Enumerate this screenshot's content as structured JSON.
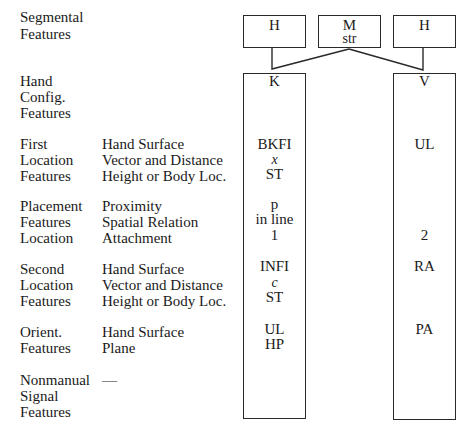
{
  "row_labels": {
    "segmental": [
      "Segmental",
      "Features"
    ],
    "hand_config": [
      "Hand",
      "Config.",
      "Features"
    ],
    "first_location": [
      "First",
      "Location",
      "Features"
    ],
    "placement": [
      "Placement",
      "Features",
      "Location"
    ],
    "second_location": [
      "Second",
      "Location",
      "Features"
    ],
    "orient": [
      "Orient.",
      "Features"
    ],
    "nonmanual": [
      "Nonmanual",
      "Signal",
      "Features"
    ]
  },
  "sub_labels": {
    "first_location": [
      "Hand Surface",
      "Vector and Distance",
      "Height or Body Loc."
    ],
    "placement": [
      "Proximity",
      "Spatial Relation",
      "Attachment"
    ],
    "second_location": [
      "Hand Surface",
      "Vector and Distance",
      "Height or Body Loc."
    ],
    "orient": [
      "Hand Surface",
      "Plane"
    ],
    "nonmanual": [
      "—"
    ]
  },
  "segments": [
    {
      "label": "H",
      "sub": ""
    },
    {
      "label": "M",
      "sub": "str"
    },
    {
      "label": "H",
      "sub": ""
    }
  ],
  "columns": {
    "left": {
      "hand_config": "K",
      "first_location": [
        "BKFI",
        "x",
        "ST"
      ],
      "placement": [
        "p",
        "in line",
        "1"
      ],
      "second_location": [
        "INFI",
        "c",
        "ST"
      ],
      "orient": [
        "UL",
        "HP"
      ]
    },
    "right": {
      "hand_config": "V",
      "first_location": [
        "UL"
      ],
      "placement": [
        "2"
      ],
      "second_location": [
        "RA"
      ],
      "orient": [
        "PA"
      ]
    }
  }
}
